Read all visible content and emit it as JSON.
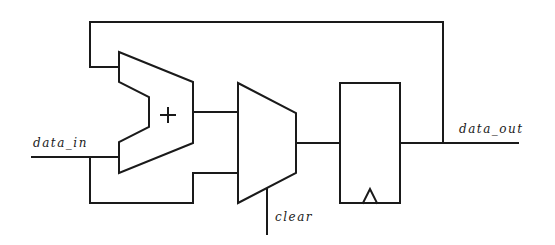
{
  "diagram": {
    "type": "datapath",
    "title": "",
    "colors": {
      "stroke": "#1a1a1a",
      "background": "#ffffff"
    },
    "labels": {
      "input": "data_in",
      "output": "data_out",
      "control": "clear"
    },
    "components": {
      "adder": {
        "symbol": "+",
        "name": "adder"
      },
      "mux": {
        "name": "multiplexer"
      },
      "register": {
        "name": "register",
        "clock": "clock-edge-triangle"
      }
    },
    "connections": [
      {
        "from": "data_in",
        "to": "adder.input_b"
      },
      {
        "from": "data_in",
        "to": "mux.input_1"
      },
      {
        "from": "adder.output",
        "to": "mux.input_0"
      },
      {
        "from": "clear",
        "to": "mux.select"
      },
      {
        "from": "mux.output",
        "to": "register.d"
      },
      {
        "from": "register.q",
        "to": "data_out"
      },
      {
        "from": "register.q",
        "to": "adder.input_a",
        "note": "feedback"
      }
    ]
  }
}
